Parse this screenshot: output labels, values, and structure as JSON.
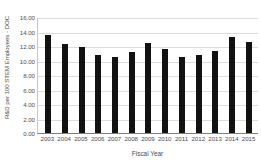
{
  "chart_data": {
    "type": "bar",
    "title": "",
    "subtitle": "",
    "xlabel": "Fiscal Year",
    "ylabel": "R&D per 100 STEM Employees - DOC",
    "categories": [
      "2003",
      "2004",
      "2005",
      "2006",
      "2007",
      "2008",
      "2009",
      "2010",
      "2011",
      "2012",
      "2013",
      "2014",
      "2015"
    ],
    "values": [
      13.5,
      12.25,
      11.85,
      10.7,
      10.45,
      11.2,
      12.4,
      11.65,
      10.5,
      10.75,
      11.25,
      13.2,
      12.6
    ],
    "ylim": [
      0,
      16
    ],
    "ytick_values": [
      16.0,
      14.0,
      12.0,
      10.0,
      8.0,
      6.0,
      4.0,
      2.0,
      0.0
    ],
    "ytick_labels": [
      "16.00",
      "14.00",
      "12.00",
      "10.00",
      "8.00",
      "6.00",
      "4.00",
      "2.00",
      "0.00"
    ],
    "grid": true,
    "legend": false,
    "legend_position": "none",
    "bar_color": "#121212",
    "gridline_color": "#dcdcdc",
    "axis_color": "#808080",
    "text_color": "#4d4d4d",
    "background_color": "#ffffff"
  }
}
